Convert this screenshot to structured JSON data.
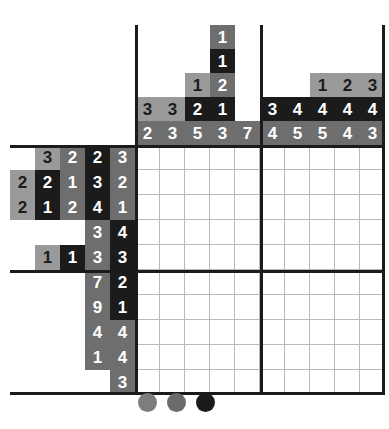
{
  "puzzle": {
    "type": "nonogram",
    "grid_size": {
      "cols": 10,
      "rows": 10
    },
    "block_size": 5,
    "column_clue_rows": 5,
    "row_clue_cols": 4,
    "column_clues": [
      {
        "index": 1,
        "values": [
          "",
          "",
          "",
          "3",
          "2"
        ]
      },
      {
        "index": 2,
        "values": [
          "",
          "",
          "",
          "3",
          "3"
        ]
      },
      {
        "index": 3,
        "values": [
          "",
          "",
          "1",
          "2",
          "5"
        ]
      },
      {
        "index": 4,
        "values": [
          "1",
          "1",
          "2",
          "1",
          "3"
        ]
      },
      {
        "index": 5,
        "values": [
          "",
          "",
          "",
          "",
          "7"
        ]
      },
      {
        "index": 6,
        "values": [
          "",
          "",
          "",
          "3",
          "4"
        ]
      },
      {
        "index": 7,
        "values": [
          "",
          "",
          "",
          "4",
          "5"
        ]
      },
      {
        "index": 8,
        "values": [
          "",
          "",
          "1",
          "4",
          "5"
        ]
      },
      {
        "index": 9,
        "values": [
          "",
          "",
          "2",
          "4",
          "4"
        ]
      },
      {
        "index": 10,
        "values": [
          "",
          "",
          "3",
          "4",
          "3"
        ]
      }
    ],
    "column_clue_styles": [
      [
        "empty",
        "empty",
        "empty",
        "light",
        "mid"
      ],
      [
        "empty",
        "empty",
        "empty",
        "light",
        "mid"
      ],
      [
        "empty",
        "empty",
        "light",
        "dark",
        "mid"
      ],
      [
        "mid",
        "dark",
        "mid",
        "dark",
        "mid"
      ],
      [
        "empty",
        "empty",
        "empty",
        "empty",
        "mid"
      ],
      [
        "empty",
        "empty",
        "empty",
        "dark",
        "mid"
      ],
      [
        "empty",
        "empty",
        "empty",
        "dark",
        "mid"
      ],
      [
        "empty",
        "empty",
        "light",
        "dark",
        "mid"
      ],
      [
        "empty",
        "empty",
        "light",
        "dark",
        "mid"
      ],
      [
        "empty",
        "empty",
        "light",
        "dark",
        "mid"
      ]
    ],
    "row_clues": [
      {
        "index": 1,
        "values": [
          "",
          "3",
          "2",
          "2",
          "3"
        ]
      },
      {
        "index": 2,
        "values": [
          "2",
          "2",
          "1",
          "3",
          "2"
        ]
      },
      {
        "index": 3,
        "values": [
          "2",
          "1",
          "2",
          "4",
          "1"
        ]
      },
      {
        "index": 4,
        "values": [
          "",
          "",
          "",
          "3",
          "4"
        ]
      },
      {
        "index": 5,
        "values": [
          "",
          "1",
          "1",
          "3",
          "3"
        ]
      },
      {
        "index": 6,
        "values": [
          "",
          "",
          "",
          "7",
          "2"
        ]
      },
      {
        "index": 7,
        "values": [
          "",
          "",
          "",
          "9",
          "1"
        ]
      },
      {
        "index": 8,
        "values": [
          "",
          "",
          "",
          "4",
          "4"
        ]
      },
      {
        "index": 9,
        "values": [
          "",
          "",
          "",
          "1",
          "4"
        ]
      },
      {
        "index": 10,
        "values": [
          "",
          "",
          "",
          "",
          "3"
        ]
      }
    ],
    "row_clue_styles": [
      [
        "empty",
        "light",
        "mid",
        "dark",
        "mid"
      ],
      [
        "light",
        "dark",
        "mid",
        "dark",
        "mid"
      ],
      [
        "light",
        "dark",
        "mid",
        "dark",
        "mid"
      ],
      [
        "empty",
        "empty",
        "empty",
        "mid",
        "dark"
      ],
      [
        "empty",
        "light",
        "dark",
        "mid",
        "dark"
      ],
      [
        "empty",
        "empty",
        "empty",
        "mid",
        "dark"
      ],
      [
        "empty",
        "empty",
        "empty",
        "mid",
        "dark"
      ],
      [
        "empty",
        "empty",
        "empty",
        "mid",
        "mid"
      ],
      [
        "empty",
        "empty",
        "empty",
        "mid",
        "mid"
      ],
      [
        "empty",
        "empty",
        "empty",
        "empty",
        "mid"
      ]
    ],
    "cells": [
      [
        "",
        "",
        "",
        "",
        "",
        "",
        "",
        "",
        "",
        ""
      ],
      [
        "",
        "",
        "",
        "",
        "",
        "",
        "",
        "",
        "",
        ""
      ],
      [
        "",
        "",
        "",
        "",
        "",
        "",
        "",
        "",
        "",
        ""
      ],
      [
        "",
        "",
        "",
        "",
        "",
        "",
        "",
        "",
        "",
        ""
      ],
      [
        "",
        "",
        "",
        "",
        "",
        "",
        "",
        "",
        "",
        ""
      ],
      [
        "",
        "",
        "",
        "",
        "",
        "",
        "",
        "",
        "",
        ""
      ],
      [
        "",
        "",
        "",
        "",
        "",
        "",
        "",
        "",
        "",
        ""
      ],
      [
        "",
        "",
        "",
        "",
        "",
        "",
        "",
        "",
        "",
        ""
      ],
      [
        "",
        "",
        "",
        "",
        "",
        "",
        "",
        "",
        "",
        ""
      ],
      [
        "",
        "",
        "",
        "",
        "",
        "",
        "",
        "",
        "",
        ""
      ]
    ]
  },
  "status_dots": [
    {
      "name": "dot-1",
      "color": "#7d7d7d"
    },
    {
      "name": "dot-2",
      "color": "#6b6b6b"
    },
    {
      "name": "dot-3",
      "color": "#1b1b1b"
    }
  ],
  "colors": {
    "dark": "#1b1b1b",
    "mid": "#6e6e6e",
    "light": "#9a9a9a",
    "grid_line": "#b9b9b9",
    "border": "#1b1b1b",
    "background": "#ffffff"
  }
}
